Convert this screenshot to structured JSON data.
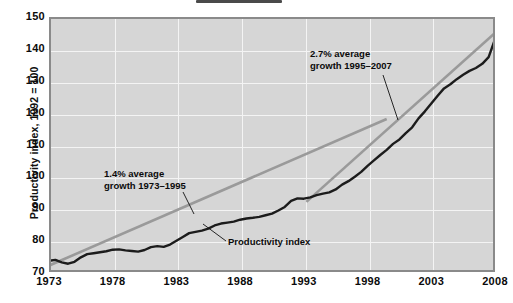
{
  "figure": {
    "top_crop_marker": "partial-element"
  },
  "chart_data": {
    "type": "line",
    "title": "",
    "xlabel": "",
    "ylabel": "Productivity index, 1992 = 100",
    "xlim": [
      1973,
      2008
    ],
    "ylim": [
      70,
      150
    ],
    "grid": true,
    "legend_position": "none",
    "y_ticks": [
      150,
      140,
      130,
      120,
      110,
      100,
      90,
      80,
      70
    ],
    "x_ticks": [
      1973,
      1978,
      1983,
      1988,
      1993,
      1998,
      2003,
      2008
    ],
    "series": [
      {
        "name": "Productivity index",
        "color": "#1c1c1c",
        "x": [
          1973,
          1973.5,
          1974,
          1974.5,
          1975,
          1975.5,
          1976,
          1976.5,
          1977,
          1977.5,
          1978,
          1978.5,
          1979,
          1979.5,
          1980,
          1980.5,
          1981,
          1981.5,
          1982,
          1982.5,
          1983,
          1983.5,
          1984,
          1984.5,
          1985,
          1985.5,
          1986,
          1986.5,
          1987,
          1987.5,
          1988,
          1988.5,
          1989,
          1989.5,
          1990,
          1990.5,
          1991,
          1991.5,
          1992,
          1992.5,
          1993,
          1993.5,
          1994,
          1994.5,
          1995,
          1995.5,
          1996,
          1996.5,
          1997,
          1997.5,
          1998,
          1998.5,
          1999,
          1999.5,
          2000,
          2000.5,
          2001,
          2001.5,
          2002,
          2002.5,
          2003,
          2003.5,
          2004,
          2004.5,
          2005,
          2005.5,
          2006,
          2006.5,
          2007,
          2007.5,
          2008
        ],
        "y": [
          73.5,
          73.8,
          73.0,
          72.6,
          73.2,
          74.6,
          75.6,
          75.9,
          76.2,
          76.5,
          77.0,
          77.1,
          76.8,
          76.6,
          76.4,
          76.9,
          77.8,
          78.1,
          77.9,
          78.6,
          79.8,
          81.0,
          82.2,
          82.6,
          83.0,
          83.6,
          84.6,
          85.2,
          85.5,
          85.8,
          86.4,
          86.8,
          87.0,
          87.3,
          87.8,
          88.3,
          89.3,
          90.4,
          92.3,
          93.1,
          93.0,
          93.4,
          94.1,
          94.6,
          95.0,
          95.9,
          97.4,
          98.5,
          99.9,
          101.4,
          103.3,
          105.0,
          106.7,
          108.3,
          110.2,
          111.6,
          113.6,
          115.4,
          118.2,
          120.4,
          122.9,
          125.3,
          127.6,
          128.9,
          130.5,
          131.9,
          133.1,
          134.0,
          135.3,
          137.4,
          143.0
        ]
      }
    ],
    "trend_lines": [
      {
        "name": "1.4% average growth 1973-1995",
        "color": "#9a9a9a",
        "x": [
          1973,
          1999.5
        ],
        "y": [
          72.0,
          118.0
        ]
      },
      {
        "name": "2.7% average growth 1995-2007",
        "color": "#9a9a9a",
        "x": [
          1993.2,
          2008
        ],
        "y": [
          92.0,
          145.0
        ]
      }
    ],
    "annotations": [
      {
        "id": "fast-growth",
        "text": "2.7% average\ngrowth 1995–2007",
        "x": 2000.4,
        "y": 137.5
      },
      {
        "id": "slow-growth",
        "text": "1.4% average\ngrowth 1973–1995",
        "x": 1983.2,
        "y": 99.0
      },
      {
        "id": "series-callout",
        "text": "Productivity index",
        "x": 1987.6,
        "y": 77.5
      }
    ]
  }
}
